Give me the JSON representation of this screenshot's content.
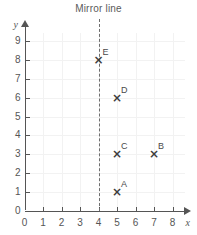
{
  "chart_data": {
    "type": "scatter",
    "title": "Mirror line",
    "xlabel": "x",
    "ylabel": "y",
    "xlim": [
      0,
      8
    ],
    "ylim": [
      0,
      9
    ],
    "grid": true,
    "legend": "none",
    "x_ticks": [
      "0",
      "1",
      "2",
      "3",
      "4",
      "5",
      "6",
      "7",
      "8"
    ],
    "y_ticks": [
      "0",
      "1",
      "2",
      "3",
      "4",
      "5",
      "6",
      "7",
      "8",
      "9"
    ],
    "marker": "×",
    "points": [
      {
        "label": "A",
        "x": 5,
        "y": 1
      },
      {
        "label": "B",
        "x": 7,
        "y": 3
      },
      {
        "label": "C",
        "x": 5,
        "y": 3
      },
      {
        "label": "D",
        "x": 5,
        "y": 6
      },
      {
        "label": "E",
        "x": 4,
        "y": 8
      }
    ],
    "annotations": [
      {
        "name": "mirror-line",
        "type": "vertical-dashed-line",
        "x": 4,
        "label": "Mirror line"
      }
    ],
    "colors": {
      "axis": "#555555",
      "grid": "#f2f2f2",
      "marker": "#3d3d3d",
      "mirror_line": "#6e6e6e",
      "text": "#555555",
      "background": "#ffffff"
    }
  }
}
